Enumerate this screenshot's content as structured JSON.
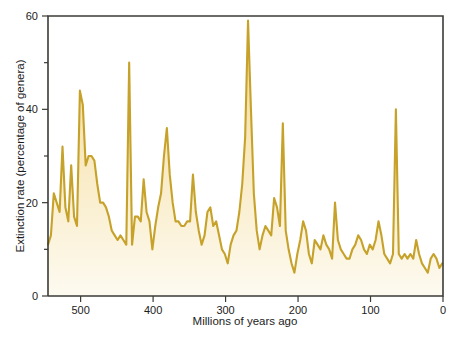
{
  "figure": {
    "cropped_top_caption": "",
    "background_color": "#ffffff"
  },
  "chart_data": {
    "type": "area",
    "title": "",
    "subtitle": "",
    "xlabel": "Millions of years ago",
    "ylabel": "Extinction rate (percentage of genera)",
    "xlim": [
      545,
      0
    ],
    "ylim": [
      0,
      60
    ],
    "x_reversed": true,
    "grid": false,
    "legend": null,
    "legend_position": "none",
    "xticks": [
      500,
      400,
      300,
      200,
      100,
      0
    ],
    "xtick_labels": [
      "500",
      "400",
      "300",
      "200",
      "100",
      "0"
    ],
    "yticks": [
      0,
      20,
      40,
      60
    ],
    "ytick_labels": [
      "0",
      "20",
      "40",
      "60"
    ],
    "y_minor_ticks": [
      10,
      30,
      50
    ],
    "colors": {
      "line": "#c6a22a",
      "fill_top": "#f5dca0",
      "fill_bottom": "#fdfaef",
      "axis": "#3b3b36",
      "text": "#1c1c1c"
    },
    "series": [
      {
        "name": "Extinction rate",
        "x": [
          545,
          541,
          537,
          533,
          529,
          525,
          521,
          517,
          513,
          509,
          505,
          501,
          497,
          493,
          489,
          485,
          481,
          477,
          473,
          469,
          465,
          461,
          457,
          453,
          449,
          445,
          441,
          437,
          433,
          429,
          425,
          421,
          417,
          413,
          409,
          405,
          401,
          397,
          393,
          389,
          385,
          381,
          377,
          373,
          369,
          365,
          361,
          357,
          353,
          349,
          345,
          341,
          337,
          333,
          329,
          325,
          321,
          317,
          313,
          309,
          305,
          301,
          297,
          293,
          289,
          285,
          281,
          277,
          273,
          269,
          265,
          261,
          257,
          253,
          249,
          245,
          241,
          237,
          233,
          229,
          225,
          221,
          217,
          213,
          209,
          205,
          201,
          197,
          193,
          189,
          185,
          181,
          177,
          173,
          169,
          165,
          161,
          157,
          153,
          149,
          145,
          141,
          137,
          133,
          129,
          125,
          121,
          117,
          113,
          109,
          105,
          101,
          97,
          93,
          89,
          85,
          81,
          77,
          73,
          69,
          65,
          61,
          57,
          53,
          49,
          45,
          41,
          37,
          33,
          29,
          25,
          21,
          17,
          13,
          9,
          5,
          1
        ],
        "values": [
          11,
          13,
          22,
          20,
          18,
          32,
          19,
          16,
          28,
          17,
          15,
          44,
          41,
          28,
          30,
          30,
          29,
          24,
          20,
          20,
          19,
          17,
          14,
          13,
          12,
          13,
          12,
          11,
          50,
          11,
          17,
          17,
          16,
          25,
          18,
          16,
          10,
          15,
          19,
          22,
          30,
          36,
          26,
          20,
          16,
          16,
          15,
          15,
          16,
          16,
          26,
          18,
          14,
          11,
          13,
          18,
          19,
          15,
          16,
          13,
          10,
          9,
          7,
          11,
          13,
          14,
          18,
          24,
          34,
          59,
          40,
          22,
          14,
          10,
          13,
          15,
          14,
          13,
          21,
          19,
          15,
          37,
          14,
          10,
          7,
          5,
          9,
          12,
          16,
          14,
          9,
          7,
          12,
          11,
          10,
          13,
          11,
          10,
          8,
          20,
          12,
          10,
          9,
          8,
          8,
          10,
          11,
          13,
          12,
          10,
          9,
          11,
          10,
          12,
          16,
          13,
          9,
          8,
          7,
          9,
          40,
          9,
          8,
          9,
          8,
          9,
          8,
          12,
          9,
          7,
          6,
          5,
          8,
          9,
          8,
          6,
          7
        ]
      }
    ]
  }
}
